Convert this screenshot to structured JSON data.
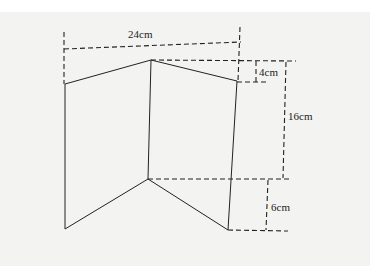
{
  "diagram": {
    "type": "folded-paper-net",
    "colors": {
      "background": "#f3f3f1",
      "stroke": "#222222"
    },
    "labels": {
      "width": "24cm",
      "peak_offset": "4cm",
      "height": "16cm",
      "bottom_offset": "6cm"
    },
    "points": {
      "left_top": [
        65,
        84
      ],
      "peak": [
        151,
        60
      ],
      "right_top": [
        237,
        81
      ],
      "mid_bottom": [
        148,
        179
      ],
      "left_bottom": [
        65,
        229
      ],
      "right_bottom": [
        228,
        230
      ]
    }
  }
}
